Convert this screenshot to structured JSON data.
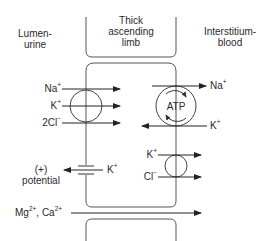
{
  "diagram": {
    "regions": {
      "lumen": {
        "line1": "Lumen-",
        "line2": "urine"
      },
      "cell": {
        "line1": "Thick",
        "line2": "ascending",
        "line3": "limb"
      },
      "interstitium": {
        "line1": "Interstitium-",
        "line2": "blood"
      }
    },
    "apical_transporter": {
      "name": "Na-K-2Cl cotransporter",
      "ions": [
        {
          "base": "Na",
          "charge": "+",
          "direction": "into-cell"
        },
        {
          "base": "K",
          "charge": "+",
          "direction": "into-cell"
        },
        {
          "base": "2Cl",
          "charge": "−",
          "direction": "into-cell"
        }
      ]
    },
    "basolateral_pump": {
      "label": "ATP",
      "ions": [
        {
          "base": "Na",
          "charge": "+",
          "direction": "to-interstitium"
        },
        {
          "base": "K",
          "charge": "+",
          "direction": "into-cell"
        }
      ]
    },
    "basolateral_cotransporter": {
      "ions": [
        {
          "base": "K",
          "charge": "+",
          "direction": "to-interstitium"
        },
        {
          "base": "Cl",
          "charge": "−",
          "direction": "to-interstitium"
        }
      ]
    },
    "apical_channel": {
      "ion": {
        "base": "K",
        "charge": "+",
        "direction": "to-lumen"
      },
      "result_line1": "(+)",
      "result_line2": "potential"
    },
    "paracellular": {
      "ion1": {
        "base": "Mg",
        "charge": "2+"
      },
      "separator": ", ",
      "ion2": {
        "base": "Ca",
        "charge": "2+"
      },
      "direction": "to-interstitium"
    },
    "colors": {
      "line": "#333333",
      "membrane": "#555555",
      "background": "#ffffff"
    }
  }
}
